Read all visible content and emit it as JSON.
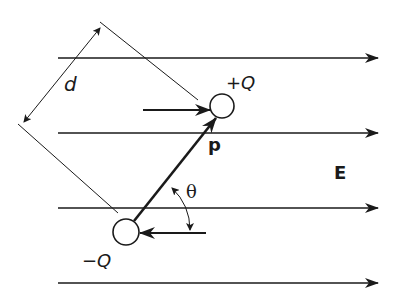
{
  "diagram": {
    "labels": {
      "distance": "d",
      "positive_charge": "+Q",
      "negative_charge": "−Q",
      "dipole_moment": "p",
      "field": "E",
      "angle": "θ"
    },
    "field_lines": [
      {
        "y": 58,
        "x1": 58,
        "x2": 378
      },
      {
        "y": 133,
        "x1": 58,
        "x2": 378
      },
      {
        "y": 208,
        "x1": 58,
        "x2": 378
      },
      {
        "y": 283,
        "x1": 58,
        "x2": 378
      }
    ],
    "charges": [
      {
        "name": "positive",
        "cx": 222,
        "cy": 106,
        "r": 12
      },
      {
        "name": "negative",
        "cx": 126,
        "cy": 232,
        "r": 13
      }
    ],
    "forces": [
      {
        "on": "positive",
        "direction": "right",
        "x1": 143,
        "x2": 210,
        "y": 110
      },
      {
        "on": "negative",
        "direction": "left",
        "x1": 206,
        "x2": 140,
        "y": 233
      }
    ],
    "colors": {
      "ink": "#1a1a1a",
      "background": "#ffffff"
    }
  }
}
